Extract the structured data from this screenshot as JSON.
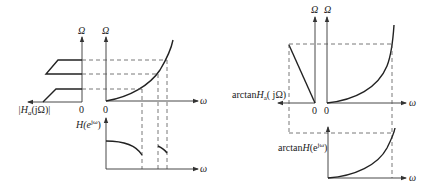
{
  "figure": {
    "left_panel": {
      "analog_axis_label": "Ω",
      "mapping_axis_label": "Ω",
      "analog_response_label_prefix": "|H",
      "analog_response_label_sub": "a",
      "analog_response_label_suffix": "(jΩ)|",
      "origin_label_analog": "0",
      "origin_label_mapping": "0",
      "digital_freq_label": "ω",
      "digital_response_label_prefix": "H(e",
      "digital_response_label_sup": "jω",
      "digital_response_label_suffix": ")",
      "digital_axis_label": "ω"
    },
    "right_panel": {
      "analog_axis_label": "Ω",
      "mapping_axis_label": "Ω",
      "analog_phase_label_prefix": "arctan",
      "analog_phase_label_H": "H",
      "analog_phase_label_sub": "a",
      "analog_phase_label_suffix": "( jΩ)",
      "origin_label_analog": "0",
      "origin_label_mapping": "0",
      "digital_freq_label": "ω",
      "digital_phase_label_prefix": "arctan",
      "digital_phase_label_H": "H",
      "digital_phase_label_paren": "(e",
      "digital_phase_label_sup": "jω",
      "digital_phase_label_suffix": ")",
      "digital_axis_label": "ω"
    }
  }
}
